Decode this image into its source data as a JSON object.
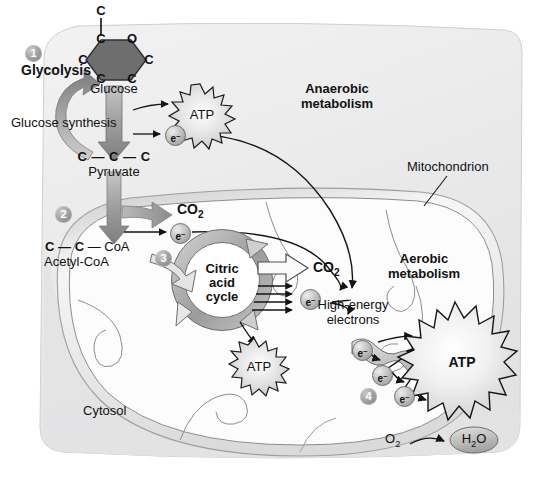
{
  "diagram": {
    "type": "biology-pathway-diagram",
    "compartments": {
      "cytosol_label": "Cytosol",
      "mitochondrion_label": "Mitochondrion",
      "anaerobic_label_line1": "Anaerobic",
      "anaerobic_label_line2": "metabolism",
      "aerobic_label_line1": "Aerobic",
      "aerobic_label_line2": "metabolism"
    },
    "steps": [
      {
        "number": "1",
        "label": "Glycolysis"
      },
      {
        "number": "2",
        "label": ""
      },
      {
        "number": "3",
        "label": ""
      },
      {
        "number": "4",
        "label": ""
      }
    ],
    "molecules": {
      "glucose_top_carbon": "C",
      "glucose_ring": [
        "C",
        "O",
        "C",
        "C",
        "C",
        "C"
      ],
      "glucose_label": "Glucose",
      "glucose_synthesis_label": "Glucose synthesis",
      "pyruvate_formula": "C — C — C",
      "pyruvate_label": "Pyruvate",
      "acetyl_coa_formula_c1": "C",
      "acetyl_coa_formula_c2": "C",
      "acetyl_coa_formula_coa": "CoA",
      "acetyl_coa_label": "Acetyl-CoA",
      "co2_step2": "CO",
      "co2_step2_sub": "2",
      "co2_step3": "CO",
      "co2_step3_sub": "2",
      "oxygen": "O",
      "oxygen_sub": "2",
      "water": "H",
      "water_sub": "2",
      "water_tail": "O"
    },
    "cycle": {
      "line1": "Citric",
      "line2": "acid",
      "line3": "cycle"
    },
    "energy": {
      "atp_glycolysis": "ATP",
      "atp_cycle": "ATP",
      "atp_chain": "ATP",
      "high_energy_line1": "High-energy",
      "high_energy_line2": "electrons"
    },
    "electron_carriers": {
      "symbol": "e",
      "charge": "–",
      "count_glycolysis": 1,
      "count_step2": 1,
      "count_cycle": 1,
      "count_chain": 3
    },
    "colors": {
      "background": "#ffffff",
      "cell_fill": "#ececed",
      "cytosol_fill": "#e6e6e7",
      "mito_fill": "#fbfbfb",
      "glucose_hex": "#6d6d6d",
      "arrow_gray": "#a0a0a0",
      "arrow_dark": "#1a1a1a",
      "text": "#111111",
      "atp_burst": "#d8d8d8",
      "marker_gray": "#8e8e8e"
    }
  }
}
